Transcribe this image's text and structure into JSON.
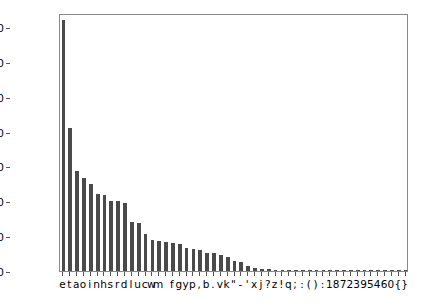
{
  "chart_data": {
    "type": "bar",
    "title": "",
    "subtitle": "",
    "xlabel": "",
    "ylabel": "",
    "categories": [
      "e",
      "t",
      "a",
      "o",
      "i",
      "n",
      "h",
      "s",
      "r",
      "d",
      "l",
      "u",
      "c",
      "w",
      "m",
      " ",
      "f",
      "g",
      "y",
      "p",
      ",",
      "b",
      ".",
      "v",
      "k",
      "\"",
      "-",
      "'",
      "x",
      "j",
      "?",
      "z",
      "!",
      "q",
      ";",
      ":",
      "(",
      ")",
      ":",
      "1",
      "8",
      "7",
      "2",
      "3",
      "9",
      "5",
      "4",
      "6",
      "0",
      "{",
      "}"
    ],
    "values": [
      72000,
      41000,
      28800,
      26600,
      25100,
      22000,
      21700,
      20200,
      20100,
      19400,
      14000,
      13800,
      10500,
      8900,
      8700,
      8300,
      8000,
      7700,
      6700,
      6200,
      6000,
      5300,
      5100,
      4600,
      3900,
      2800,
      2500,
      1400,
      900,
      700,
      500,
      420,
      350,
      300,
      250,
      200,
      170,
      150,
      130,
      110,
      95,
      85,
      75,
      65,
      55,
      45,
      38,
      30,
      22,
      15,
      10
    ],
    "ylim": [
      0,
      74000
    ],
    "yticks": [
      0,
      10000,
      20000,
      30000,
      40000,
      50000,
      60000,
      70000
    ],
    "ytick_labels": [
      "0",
      "10000",
      "20000",
      "30000",
      "40000",
      "50000",
      "60000",
      "70000"
    ],
    "grid": false,
    "legend": null,
    "bar_color": "#4a4a4a",
    "axes_color": "#888888",
    "background_color": "#ffffff",
    "xtick_label_string": "etaoinhsrdlucwm fgyp,b.vk\"-'xj?z!q;():1872395460{}"
  }
}
